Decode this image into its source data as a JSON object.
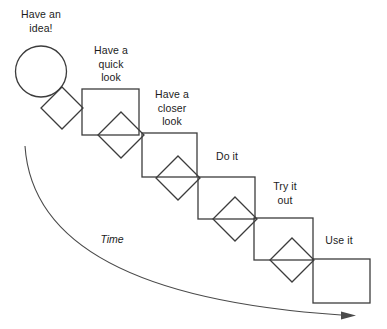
{
  "diagram": {
    "background_color": "#ffffff",
    "stroke_color": "#3c3c3c",
    "curve_color": "#4a4a4a",
    "text_color": "#1c1c1c",
    "steps": [
      {
        "id": "step-1",
        "label": "Have an\nidea!",
        "shape": "circle",
        "shape_cx": 41,
        "shape_cy": 71.5,
        "shape_r": 25.5,
        "label_x": 8,
        "label_y": 8,
        "label_width": 66
      },
      {
        "id": "step-2",
        "label": "Have a\nquick\nlook",
        "shape": "rect",
        "shape_x": 82,
        "shape_y": 89,
        "shape_w": 57,
        "shape_h": 46,
        "label_x": 78,
        "label_y": 44,
        "label_width": 66
      },
      {
        "id": "step-3",
        "label": "Have a\ncloser\nlook",
        "shape": "rect",
        "shape_x": 142,
        "shape_y": 133,
        "shape_w": 55,
        "shape_h": 44,
        "label_x": 139,
        "label_y": 88,
        "label_width": 66
      },
      {
        "id": "step-4",
        "label": "Do it",
        "shape": "rect",
        "shape_x": 198,
        "shape_y": 177,
        "shape_w": 57,
        "shape_h": 42,
        "label_x": 194,
        "label_y": 150,
        "label_width": 66
      },
      {
        "id": "step-5",
        "label": "Try it\nout",
        "shape": "rect",
        "shape_x": 254,
        "shape_y": 218,
        "shape_w": 59,
        "shape_h": 42,
        "label_x": 252,
        "label_y": 180,
        "label_width": 66
      },
      {
        "id": "step-6",
        "label": "Use it",
        "shape": "rect",
        "shape_x": 313,
        "shape_y": 259,
        "shape_w": 57,
        "shape_h": 44,
        "label_x": 306,
        "label_y": 234,
        "label_width": 66
      }
    ],
    "connectors": [
      {
        "id": "diamond-1",
        "cx": 62,
        "cy": 108,
        "half": 21
      },
      {
        "id": "diamond-2",
        "cx": 121,
        "cy": 135,
        "half": 23
      },
      {
        "id": "diamond-3",
        "cx": 178,
        "cy": 178,
        "half": 22
      },
      {
        "id": "diamond-4",
        "cx": 235,
        "cy": 219,
        "half": 22
      },
      {
        "id": "diamond-5",
        "cx": 292,
        "cy": 260,
        "half": 22
      }
    ],
    "time_axis": {
      "label": "Time",
      "label_x": 92,
      "label_y": 233,
      "label_width": 40,
      "path": "M 25,146 C 31,236 118,300 341,315",
      "arrow_points": "341,311.5 356,315.5 341,319.5"
    }
  }
}
